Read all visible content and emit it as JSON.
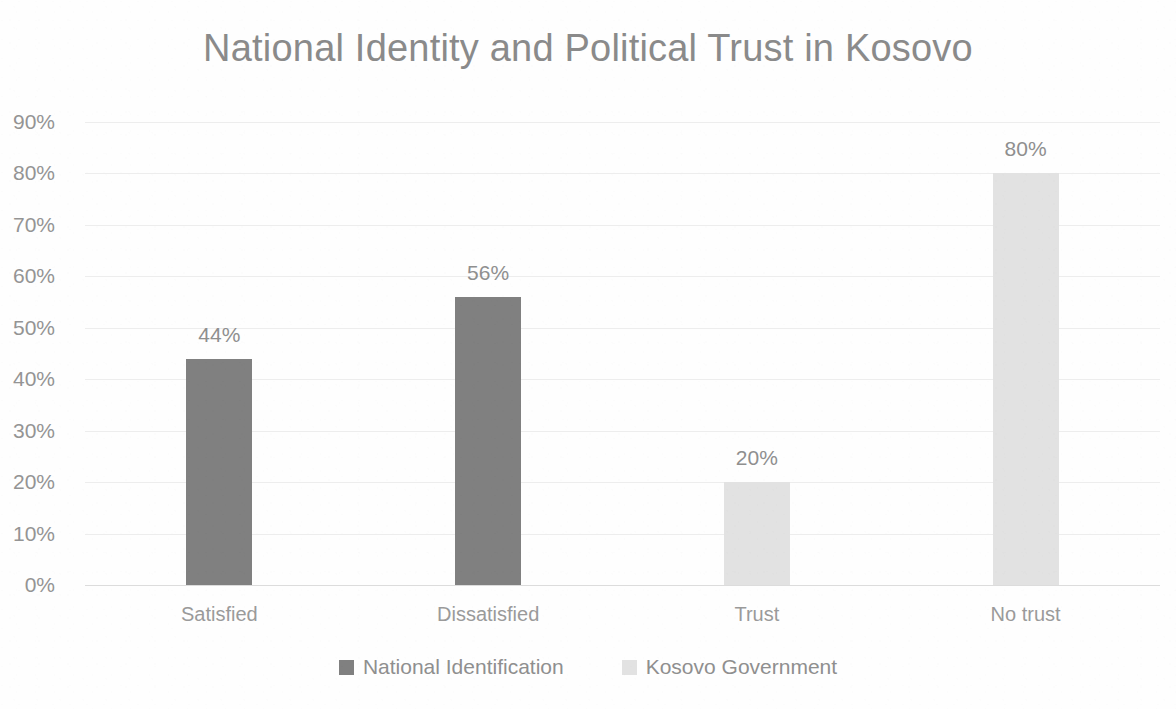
{
  "chart_data": {
    "type": "bar",
    "title": "National Identity and Political Trust in Kosovo",
    "xlabel": "",
    "ylabel": "",
    "categories": [
      "Satisfied",
      "Dissatisfied",
      "Trust",
      "No trust"
    ],
    "values": [
      44,
      56,
      20,
      80
    ],
    "value_labels": [
      "44%",
      "56%",
      "20%",
      "80%"
    ],
    "series_of_category": [
      "National Identification",
      "National Identification",
      "Kosovo Government",
      "Kosovo Government"
    ],
    "series": [
      {
        "name": "National Identification",
        "color": "#808080",
        "values": [
          44,
          56,
          null,
          null
        ]
      },
      {
        "name": "Kosovo Government",
        "color": "#e2e2e2",
        "values": [
          null,
          null,
          20,
          80
        ]
      }
    ],
    "ylim": [
      0,
      90
    ],
    "ytick_values": [
      90,
      80,
      70,
      60,
      50,
      40,
      30,
      20,
      10,
      0
    ],
    "ytick_labels": [
      "90%",
      "80%",
      "70%",
      "60%",
      "50%",
      "40%",
      "30%",
      "20%",
      "10%",
      "0%"
    ],
    "grid": true,
    "grid_orientation": "horizontal",
    "legend_position": "bottom",
    "value_labels_shown": true
  },
  "legend": {
    "items": [
      {
        "label": "National Identification",
        "color": "#808080"
      },
      {
        "label": "Kosovo Government",
        "color": "#e2e2e2"
      }
    ]
  },
  "colors": {
    "series_dark": "#808080",
    "series_light": "#e2e2e2",
    "text": "#8f8f8f",
    "title": "#8a8a8a",
    "gridline": "#ededed",
    "background": "#ffffff"
  }
}
